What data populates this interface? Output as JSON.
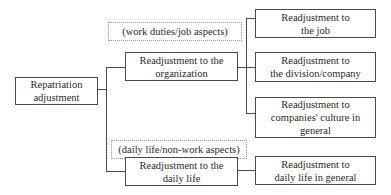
{
  "diagram": {
    "root": {
      "label": "Repatriation\nadjustment"
    },
    "branches": [
      {
        "note": "(work duties/job aspects)",
        "label": "Readjustment to the\norganization",
        "children": [
          {
            "label": "Readjustment to\nthe job"
          },
          {
            "label": "Readjustment to\nthe division/company"
          },
          {
            "label": "Readjustment to\ncompanies' culture in\ngeneral"
          }
        ]
      },
      {
        "note": "(daily life/non-work aspects)",
        "label": "Readjustment to the\ndaily life",
        "children": [
          {
            "label": "Readjustment to\ndaily life in general"
          }
        ]
      }
    ]
  },
  "colors": {
    "border": "#4a4a4a",
    "note_border": "#9a9a9a",
    "text": "#2a2a2a",
    "background": "#ffffff"
  }
}
